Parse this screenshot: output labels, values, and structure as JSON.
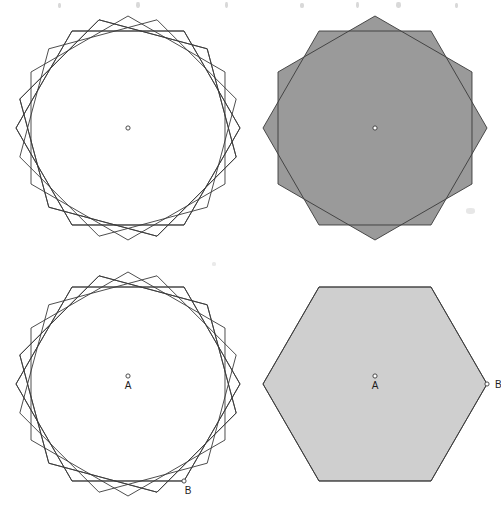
{
  "figure": {
    "stroke_color": "#3a3a3a",
    "fill_white": "#ffffff",
    "fill_light_grey": "#cfcfcf",
    "fill_dark_grey": "#9a9a9a",
    "background": "#ffffff",
    "line_width": 0.9
  },
  "labels": {
    "centre_marker": "o",
    "centre_name": "A",
    "vertex_name": "B"
  },
  "panels": [
    {
      "id": "top-left",
      "name": "panel-top-left",
      "caption": "",
      "centre": {
        "cx": 128,
        "cy": 128
      },
      "radius": 112,
      "rotation_start": 0,
      "rotation_step": 15,
      "copies": 6,
      "shade": "dark",
      "shows_centre_marker": true,
      "shows_centre_label": false,
      "shows_vertex_label": false,
      "rotations": [
        0,
        15,
        30,
        45,
        60,
        75
      ]
    },
    {
      "id": "top-right",
      "name": "panel-top-right",
      "caption": "",
      "centre": {
        "cx": 125,
        "cy": 128
      },
      "radius": 112,
      "rotation_start": 0,
      "rotation_step": 30,
      "copies": 2,
      "shade": "dark",
      "shows_centre_marker": true,
      "shows_centre_label": false,
      "shows_vertex_label": false,
      "rotations": [
        0,
        30
      ]
    },
    {
      "id": "bottom-left",
      "name": "panel-bottom-left",
      "caption": "",
      "centre": {
        "cx": 128,
        "cy": 128
      },
      "radius": 112,
      "rotation_start": 0,
      "rotation_step": 15,
      "copies": 6,
      "shade": "light",
      "shows_centre_marker": true,
      "shows_centre_label": true,
      "shows_vertex_label": true,
      "rotations": [
        0,
        15,
        30,
        45,
        60,
        75
      ]
    },
    {
      "id": "bottom-right",
      "name": "panel-bottom-right",
      "caption": "",
      "centre": {
        "cx": 125,
        "cy": 128
      },
      "radius": 112,
      "rotation_start": 0,
      "rotation_step": 60,
      "copies": 2,
      "shade": "light",
      "shows_centre_marker": true,
      "shows_centre_label": true,
      "shows_vertex_label": true,
      "rotations": [
        0,
        60
      ]
    }
  ],
  "chart_data": {
    "type": "diagram",
    "shape": "regular hexagon",
    "vertices": 6,
    "centre_of_rotation": "A",
    "marked_vertex": "B",
    "panels": [
      {
        "id": "top-left",
        "rotation_angles_deg": [
          0,
          15,
          30,
          45,
          60,
          75
        ],
        "shading": "dark grey overlaps"
      },
      {
        "id": "top-right",
        "rotation_angles_deg": [
          0,
          30
        ],
        "shading": "dark grey overlaps"
      },
      {
        "id": "bottom-left",
        "rotation_angles_deg": [
          0,
          15,
          30,
          45,
          60,
          75
        ],
        "shading": "light grey overlaps"
      },
      {
        "id": "bottom-right",
        "rotation_angles_deg": [
          0,
          60
        ],
        "shading": "light grey overlaps"
      }
    ]
  }
}
